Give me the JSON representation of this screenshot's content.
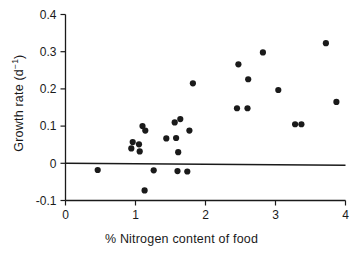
{
  "chart_data": {
    "type": "scatter",
    "title": "",
    "xlabel": "% Nitrogen content of food",
    "ylabel": "Growth rate (d-1)",
    "ylabel_base": "Growth rate (d",
    "ylabel_sup": "−1",
    "ylabel_close": ")",
    "xlim": [
      0,
      4
    ],
    "ylim": [
      -0.1,
      0.4
    ],
    "xticks": [
      0,
      1,
      2,
      3,
      4
    ],
    "xtick_labels": [
      "0",
      "1",
      "2",
      "3",
      "4"
    ],
    "yticks": [
      -0.1,
      0,
      0.1,
      0.2,
      0.3,
      0.4
    ],
    "ytick_labels": [
      "-0.1",
      "0",
      "0.1",
      "0.2",
      "0.3",
      "0.4"
    ],
    "grid": false,
    "legend": null,
    "marker": "filled-circle",
    "marker_color": "#1a1a1a",
    "marker_size": 3.1,
    "reference_line": {
      "type": "horizontal",
      "y": 0,
      "color": "#1a1a1a",
      "label": "zero growth line"
    },
    "points": [
      {
        "x": 0.46,
        "y": -0.018
      },
      {
        "x": 0.94,
        "y": 0.04
      },
      {
        "x": 0.96,
        "y": 0.057
      },
      {
        "x": 1.05,
        "y": 0.051
      },
      {
        "x": 1.06,
        "y": 0.032
      },
      {
        "x": 1.1,
        "y": 0.1
      },
      {
        "x": 1.14,
        "y": 0.088
      },
      {
        "x": 1.13,
        "y": -0.073
      },
      {
        "x": 1.26,
        "y": -0.019
      },
      {
        "x": 1.44,
        "y": 0.067
      },
      {
        "x": 1.56,
        "y": 0.11
      },
      {
        "x": 1.58,
        "y": 0.068
      },
      {
        "x": 1.61,
        "y": 0.03
      },
      {
        "x": 1.6,
        "y": -0.021
      },
      {
        "x": 1.64,
        "y": 0.119
      },
      {
        "x": 1.74,
        "y": -0.022
      },
      {
        "x": 1.77,
        "y": 0.088
      },
      {
        "x": 1.82,
        "y": 0.215
      },
      {
        "x": 2.45,
        "y": 0.148
      },
      {
        "x": 2.47,
        "y": 0.266
      },
      {
        "x": 2.6,
        "y": 0.148
      },
      {
        "x": 2.61,
        "y": 0.226
      },
      {
        "x": 2.82,
        "y": 0.298
      },
      {
        "x": 3.04,
        "y": 0.197
      },
      {
        "x": 3.28,
        "y": 0.105
      },
      {
        "x": 3.37,
        "y": 0.105
      },
      {
        "x": 3.72,
        "y": 0.323
      },
      {
        "x": 3.87,
        "y": 0.165
      }
    ]
  },
  "axes": {
    "x_label_text": "% Nitrogen content of food"
  }
}
